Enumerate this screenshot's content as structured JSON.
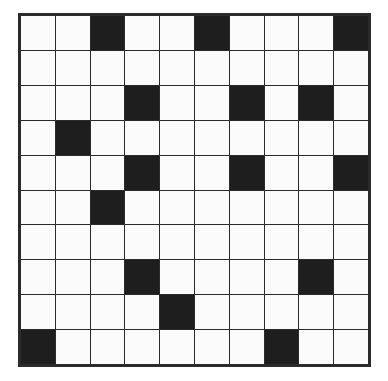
{
  "puzzle": {
    "type": "grid",
    "rows": 10,
    "cols": 10,
    "colors": {
      "white": "#fbfbfb",
      "black": "#1e1e1e",
      "border": "#2b2b2b"
    },
    "black_cells": [
      [
        0,
        2
      ],
      [
        0,
        5
      ],
      [
        0,
        9
      ],
      [
        2,
        3
      ],
      [
        2,
        6
      ],
      [
        2,
        8
      ],
      [
        3,
        1
      ],
      [
        4,
        3
      ],
      [
        4,
        6
      ],
      [
        4,
        9
      ],
      [
        5,
        2
      ],
      [
        7,
        3
      ],
      [
        7,
        8
      ],
      [
        8,
        4
      ],
      [
        9,
        0
      ],
      [
        9,
        7
      ]
    ]
  }
}
